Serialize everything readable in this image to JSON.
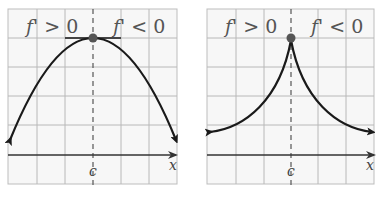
{
  "panels": [
    {
      "id": "left",
      "label_left": "f' > 0",
      "label_right": "f' < 0",
      "critical_point_label": "c",
      "x_axis_label": "x",
      "curve_type": "smooth-maximum (parabola, horizontal tangent)"
    },
    {
      "id": "right",
      "label_left": "f' > 0",
      "label_right": "f' < 0",
      "critical_point_label": "c",
      "x_axis_label": "x",
      "curve_type": "cusp maximum (derivative undefined)"
    }
  ],
  "colors": {
    "grid": "#b8b8b8",
    "curve": "#1a1a1a",
    "point": "#555555",
    "text": "#555555"
  }
}
